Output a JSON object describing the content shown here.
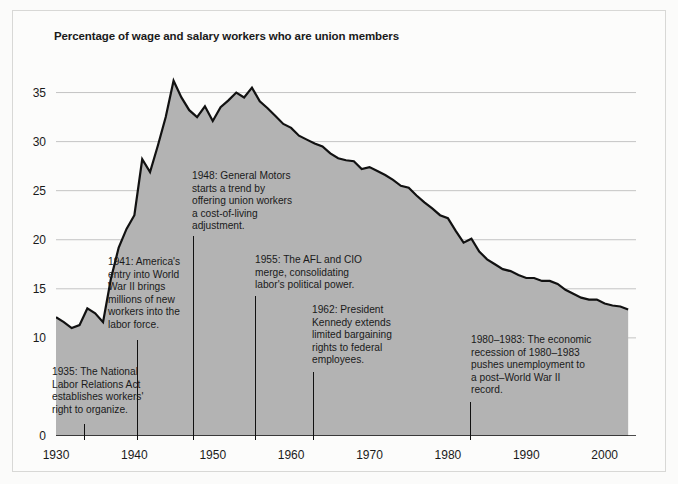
{
  "chart_data": {
    "type": "area",
    "title": "Percentage of wage and salary workers who are union members",
    "xlabel": "",
    "ylabel": "",
    "xlim": [
      1930,
      2004
    ],
    "ylim": [
      0,
      37.5
    ],
    "grid": true,
    "legend": "none",
    "y_ticks": [
      0,
      10,
      15,
      20,
      25,
      30,
      35
    ],
    "y_tick_labels": [
      "0",
      "10",
      "15",
      "20",
      "25",
      "30",
      "35"
    ],
    "x_ticks": [
      1930,
      1940,
      1950,
      1960,
      1970,
      1980,
      1990,
      2000
    ],
    "x_tick_labels": [
      "1930",
      "1940",
      "1950",
      "1960",
      "1970",
      "1980",
      "1990",
      "2000"
    ],
    "x_minor_tick_interval": 1,
    "x_medium_tick_interval": 5,
    "series_name": "Union membership rate",
    "area_fill_color": "#b3b3b3",
    "line_color": "#111111",
    "x": [
      1930,
      1931,
      1932,
      1933,
      1934,
      1935,
      1936,
      1937,
      1938,
      1939,
      1940,
      1941,
      1942,
      1943,
      1944,
      1945,
      1946,
      1947,
      1948,
      1949,
      1950,
      1951,
      1952,
      1953,
      1954,
      1955,
      1956,
      1957,
      1958,
      1959,
      1960,
      1961,
      1962,
      1963,
      1964,
      1965,
      1966,
      1967,
      1968,
      1969,
      1970,
      1971,
      1972,
      1973,
      1974,
      1975,
      1976,
      1977,
      1978,
      1979,
      1980,
      1981,
      1982,
      1983,
      1984,
      1985,
      1986,
      1987,
      1988,
      1989,
      1990,
      1991,
      1992,
      1993,
      1994,
      1995,
      1996,
      1997,
      1998,
      1999,
      2000,
      2001,
      2002,
      2003
    ],
    "y": [
      12.1,
      11.6,
      11.0,
      11.3,
      13.0,
      12.5,
      11.6,
      16.0,
      19.2,
      21.1,
      22.5,
      28.2,
      26.9,
      29.6,
      32.5,
      36.2,
      34.5,
      33.2,
      32.5,
      33.6,
      32.1,
      33.5,
      34.2,
      35.0,
      34.5,
      35.5,
      34.1,
      33.4,
      32.6,
      31.8,
      31.4,
      30.6,
      30.2,
      29.8,
      29.5,
      28.8,
      28.3,
      28.1,
      28.0,
      27.2,
      27.4,
      27.0,
      26.6,
      26.1,
      25.5,
      25.3,
      24.5,
      23.8,
      23.2,
      22.5,
      22.2,
      20.9,
      19.7,
      20.1,
      18.8,
      18.0,
      17.5,
      17.0,
      16.8,
      16.4,
      16.1,
      16.1,
      15.8,
      15.8,
      15.5,
      14.9,
      14.5,
      14.1,
      13.9,
      13.9,
      13.5,
      13.3,
      13.2,
      12.9
    ]
  },
  "annotations": [
    {
      "id": "ann-1935",
      "year": 1935,
      "text": "1935: The National\nLabor Relations Act\nestablishes workers'\nright to organize.",
      "left": 52,
      "top": 366,
      "leader_x": 84,
      "leader_top": 424,
      "leader_bottom": 440
    },
    {
      "id": "ann-1941",
      "year": 1941,
      "text": "1941: America's\nentry into World\nWar II brings\nmillions of new\nworkers into the\nlabor force.",
      "left": 108,
      "top": 256,
      "leader_x": 137,
      "leader_top": 340,
      "leader_bottom": 440
    },
    {
      "id": "ann-1948",
      "year": 1948,
      "text": "1948: General Motors\nstarts a trend by\noffering union workers\na cost-of-living\nadjustment.",
      "left": 192,
      "top": 170,
      "leader_x": 193,
      "leader_top": 236,
      "leader_bottom": 440
    },
    {
      "id": "ann-1955",
      "year": 1955,
      "text": "1955: The AFL and CIO\nmerge, consolidating\nlabor's political power.",
      "left": 255,
      "top": 254,
      "leader_x": 255,
      "leader_top": 296,
      "leader_bottom": 440
    },
    {
      "id": "ann-1962",
      "year": 1962,
      "text": "1962: President\nKennedy extends\nlimited bargaining\nrights to federal\nemployees.",
      "left": 312,
      "top": 304,
      "leader_x": 313,
      "leader_top": 372,
      "leader_bottom": 440
    },
    {
      "id": "ann-1980",
      "year": 1980,
      "text": "1980–1983: The economic\nrecession of 1980–1983\npushes unemployment to\na post–World War II\nrecord.",
      "left": 471,
      "top": 334,
      "leader_x": 470,
      "leader_top": 402,
      "leader_bottom": 440
    }
  ]
}
